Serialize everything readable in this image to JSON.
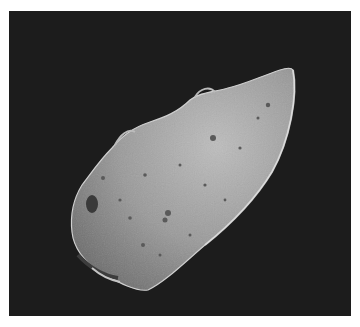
{
  "image": {
    "subject": "asteroid",
    "description": "Grayscale photograph of an irregular, elongated cratered asteroid against a black space background",
    "background_color": "#1c1c1c",
    "surface_color": "#9a9a9a",
    "highlight_color": "#c8c8c8",
    "shadow_color": "#4a4a4a"
  },
  "caption": {
    "text": ""
  }
}
